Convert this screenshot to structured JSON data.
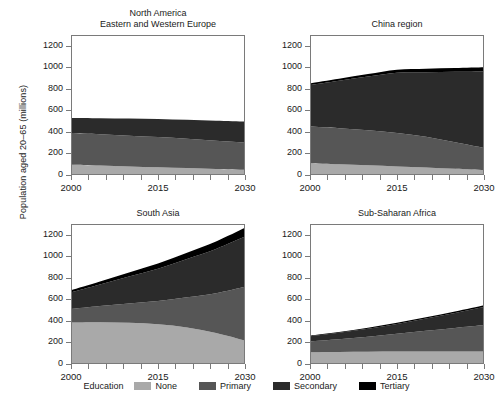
{
  "figure": {
    "ylabel": "Population aged 20–65 (millions)",
    "legend_title": "Education",
    "bg": "#ffffff",
    "axis_color": "#7a7a7a"
  },
  "legend": {
    "items": [
      {
        "label": "None",
        "color": "#a9a9a9"
      },
      {
        "label": "Primary",
        "color": "#565656"
      },
      {
        "label": "Secondary",
        "color": "#2b2b2b"
      },
      {
        "label": "Tertiary",
        "color": "#000000"
      }
    ]
  },
  "axis": {
    "yticks": [
      "0",
      "200",
      "400",
      "600",
      "800",
      "1000",
      "1200"
    ],
    "ytick_values": [
      0,
      200,
      400,
      600,
      800,
      1000,
      1200
    ],
    "xticks": [
      "2000",
      "2015",
      "2030"
    ],
    "xtick_values": [
      2000,
      2015,
      2030
    ],
    "ylim": [
      0,
      1300
    ],
    "xlim": [
      2000,
      2030
    ]
  },
  "chart_data": {
    "type": "area",
    "title": "",
    "xlabel": "",
    "ylabel": "Population aged 20–65 (millions)",
    "xlim": [
      2000,
      2030
    ],
    "ylim": [
      0,
      1300
    ],
    "grid": false,
    "legend_position": "bottom",
    "legend_title": "Education",
    "stacked": true,
    "x": [
      2000,
      2005,
      2010,
      2015,
      2020,
      2025,
      2030
    ],
    "series_names": [
      "None",
      "Primary",
      "Secondary",
      "Tertiary"
    ],
    "series_colors": [
      "#a9a9a9",
      "#565656",
      "#2b2b2b",
      "#000000"
    ],
    "panels": [
      {
        "title": "North America\nEastern and Western Europe",
        "title_lines": [
          "North America",
          "Eastern and Western Europe"
        ],
        "series": [
          {
            "name": "None",
            "values": [
              95,
              88,
              80,
              72,
              64,
              56,
              48
            ]
          },
          {
            "name": "Primary",
            "values": [
              295,
              290,
              285,
              280,
              272,
              262,
              252
            ]
          },
          {
            "name": "Secondary",
            "values": [
              140,
              150,
              160,
              168,
              176,
              186,
              196
            ]
          },
          {
            "name": "Tertiary",
            "values": [
              0,
              0,
              0,
              0,
              0,
              0,
              0
            ]
          }
        ],
        "totals": [
          530,
          528,
          525,
          520,
          512,
          504,
          496
        ]
      },
      {
        "title": "China region",
        "title_lines": [
          "China region"
        ],
        "series": [
          {
            "name": "None",
            "values": [
              110,
              100,
              90,
              80,
              70,
              58,
              46
            ]
          },
          {
            "name": "Primary",
            "values": [
              340,
              335,
              325,
              310,
              285,
              245,
              205
            ]
          },
          {
            "name": "Secondary",
            "values": [
              385,
              440,
              500,
              560,
              600,
              655,
              710
            ]
          },
          {
            "name": "Tertiary",
            "values": [
              15,
              18,
              22,
              28,
              32,
              36,
              40
            ]
          }
        ],
        "totals": [
          850,
          893,
          937,
          978,
          987,
          994,
          1001
        ]
      },
      {
        "title": "South Asia",
        "title_lines": [
          "South Asia"
        ],
        "series": [
          {
            "name": "None",
            "values": [
              385,
              388,
              382,
              370,
              340,
              288,
              218
            ]
          },
          {
            "name": "Primary",
            "values": [
              125,
              150,
              180,
              215,
              280,
              370,
              500
            ]
          },
          {
            "name": "Secondary",
            "values": [
              155,
              200,
              250,
              300,
              355,
              410,
              465
            ]
          },
          {
            "name": "Tertiary",
            "values": [
              20,
              28,
              38,
              48,
              58,
              70,
              82
            ]
          }
        ],
        "totals": [
          685,
          766,
          850,
          933,
          1033,
          1138,
          1265
        ]
      },
      {
        "title": "Sub-Saharan Africa",
        "title_lines": [
          "Sub-Saharan Africa"
        ],
        "series": [
          {
            "name": "None",
            "values": [
              110,
              112,
              114,
              115,
              116,
              116,
              116
            ]
          },
          {
            "name": "Primary",
            "values": [
              100,
              118,
              140,
              165,
              192,
              218,
              245
            ]
          },
          {
            "name": "Secondary",
            "values": [
              48,
              60,
              74,
              92,
              114,
              140,
              168
            ]
          },
          {
            "name": "Tertiary",
            "values": [
              5,
              6,
              8,
              10,
              12,
              14,
              17
            ]
          }
        ],
        "totals": [
          263,
          296,
          336,
          382,
          434,
          488,
          546
        ]
      }
    ]
  }
}
